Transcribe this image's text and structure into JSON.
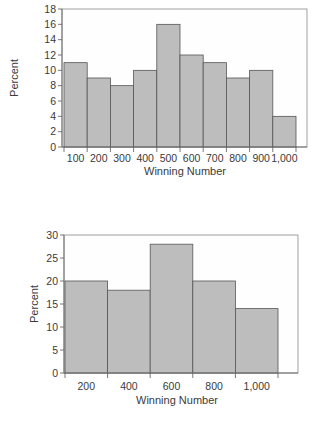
{
  "chart_data": [
    {
      "type": "bar",
      "subtype": "histogram",
      "title": "",
      "xlabel": "Winning Number",
      "ylabel": "Percent",
      "categories": [
        "100",
        "200",
        "300",
        "400",
        "500",
        "600",
        "700",
        "800",
        "900",
        "1,000"
      ],
      "values": [
        11,
        9,
        8,
        10,
        16,
        12,
        11,
        9,
        10,
        4
      ],
      "yticks": [
        0,
        2,
        4,
        6,
        8,
        10,
        12,
        14,
        16,
        18
      ],
      "ylim": [
        0,
        18
      ],
      "grid": false,
      "legend": null,
      "bar_color": "#bdbdbd",
      "layout": {
        "frame": {
          "left": 62,
          "top": 9,
          "right": 307,
          "bottom": 147
        },
        "bars_left": 64,
        "bars_right": 296,
        "ylabel_x": 18,
        "xlabel_y": 175,
        "xtick_label_y": 162
      }
    },
    {
      "type": "bar",
      "subtype": "histogram",
      "title": "",
      "xlabel": "Winning Number",
      "ylabel": "Percent",
      "categories": [
        "200",
        "400",
        "600",
        "800",
        "1,000"
      ],
      "values": [
        20,
        18,
        28,
        20,
        14
      ],
      "yticks": [
        0,
        5,
        10,
        15,
        20,
        25,
        30
      ],
      "ylim": [
        0,
        30
      ],
      "grid": false,
      "legend": null,
      "bar_color": "#bdbdbd",
      "layout": {
        "frame": {
          "left": 64,
          "top": 235,
          "right": 298,
          "bottom": 373
        },
        "bars_left": 65,
        "bars_right": 278,
        "ylabel_x": 38,
        "xlabel_y": 404,
        "xtick_label_y": 390
      }
    }
  ]
}
